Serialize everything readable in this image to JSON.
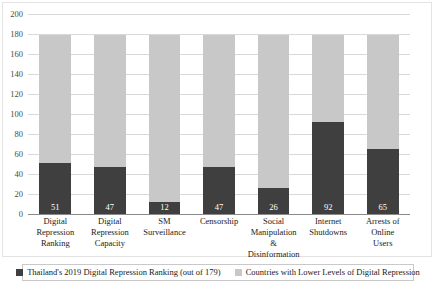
{
  "chart_data": {
    "type": "bar",
    "subtype": "stacked-bar",
    "title": "",
    "xlabel": "",
    "ylabel": "",
    "ylim": [
      0,
      200
    ],
    "ytick_step": 20,
    "yticks": [
      200,
      180,
      160,
      140,
      120,
      100,
      80,
      60,
      40,
      20,
      0
    ],
    "grid": true,
    "legend_position": "bottom",
    "total_countries": 179,
    "categories": [
      "Digital Repression Ranking",
      "Digital Repression Capacity",
      "SM Surveillance",
      "Censorship",
      "Social Manipulation & Disinformation",
      "Internet Shutdowns",
      "Arrests of Online Users"
    ],
    "category_lines": [
      [
        "Digital",
        "Repression",
        "Ranking"
      ],
      [
        "Digital",
        "Repression",
        "Capacity"
      ],
      [
        "SM",
        "Surveillance"
      ],
      [
        "Censorship"
      ],
      [
        "Social",
        "Manipulation &",
        "Disinformation"
      ],
      [
        "Internet",
        "Shutdowns"
      ],
      [
        "Arrests of",
        "Online",
        "Users"
      ]
    ],
    "series": [
      {
        "name": "Thailand's 2019 Digital Repression Ranking (out of 179)",
        "color": "#3f3f3f",
        "values": [
          51,
          47,
          12,
          47,
          26,
          92,
          65
        ]
      },
      {
        "name": "Countries with Lower Levels of Digital Repression",
        "color": "#c8c8c8",
        "values": [
          128,
          132,
          167,
          132,
          153,
          87,
          114
        ]
      }
    ],
    "data_labels": [
      "51",
      "47",
      "12",
      "47",
      "26",
      "92",
      "65"
    ]
  },
  "legend": {
    "items": [
      {
        "label": "Thailand's 2019 Digital Repression Ranking (out of 179)",
        "color": "#3f3f3f"
      },
      {
        "label": "Countries with Lower Levels of Digital Repression",
        "color": "#c8c8c8"
      }
    ]
  },
  "yticks": [
    {
      "label": "200"
    },
    {
      "label": "180"
    },
    {
      "label": "160"
    },
    {
      "label": "140"
    },
    {
      "label": "120"
    },
    {
      "label": "100"
    },
    {
      "label": "80"
    },
    {
      "label": "60"
    },
    {
      "label": "40"
    },
    {
      "label": "20"
    },
    {
      "label": "0"
    }
  ]
}
